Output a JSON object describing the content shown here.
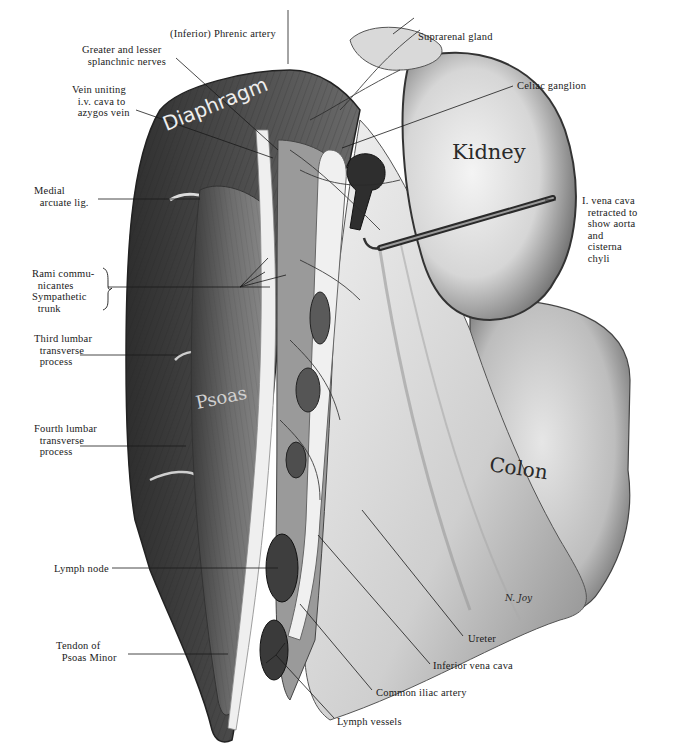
{
  "figure": {
    "type": "anatomical-illustration",
    "signature": "N. Joy",
    "palette": {
      "background": "#ffffff",
      "ink": "#1a1a1a",
      "muscle_dark": "#3a3a3a",
      "muscle_mid": "#7a7a7a",
      "tissue_light": "#e8e8e8"
    }
  },
  "organ_labels": {
    "diaphragm": "Diaphragm",
    "kidney": "Kidney",
    "psoas": "Psoas",
    "colon": "Colon"
  },
  "labels": {
    "phrenic_artery": "(Inferior) Phrenic artery",
    "splanchnic_nerves": "Greater and lesser\n  splanchnic nerves",
    "vein_uniting": "Vein uniting\n  i.v. cava to\n  azygos vein",
    "medial_arcuate": "Medial\n  arcuate lig.",
    "rami": "Rami commu-\n  nicantes\nSympathetic\n  trunk",
    "third_lumbar": "Third lumbar\n  transverse\n  process",
    "fourth_lumbar": "Fourth lumbar\n  transverse\n  process",
    "lymph_node": "Lymph node",
    "tendon_psoas_minor": "Tendon of\n  Psoas Minor",
    "suprarenal_gland": "Suprarenal gland",
    "celiac_ganglion": "Celiac ganglion",
    "ivc_retracted": "I. vena cava\n  retracted to\n  show aorta\n  and\n  cisterna\n  chyli",
    "ureter": "Ureter",
    "inferior_vena_cava": "Inferior vena cava",
    "common_iliac_artery": "Common iliac artery",
    "lymph_vessels": "Lymph vessels"
  }
}
